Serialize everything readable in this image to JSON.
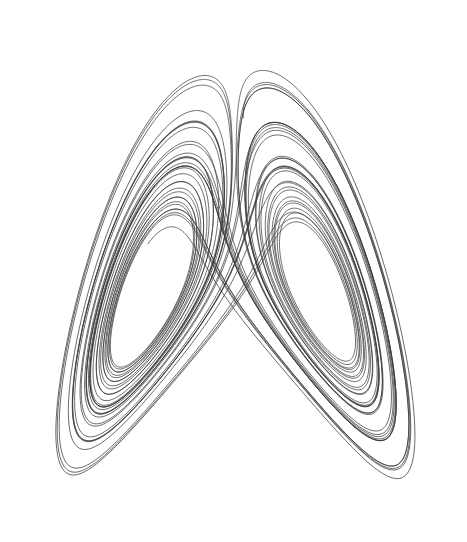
{
  "figure": {
    "title": "",
    "background_color": "#ffffff",
    "width": 467,
    "height": 542
  },
  "chart_data": {
    "type": "line",
    "title": "",
    "subtitle": "",
    "xlabel": "",
    "ylabel": "",
    "legend": [],
    "legend_position": "none",
    "grid": false,
    "axes_visible": false,
    "tick_labels_x": [],
    "tick_labels_y": [],
    "series": [
      {
        "name": "lorenz-trajectory",
        "color": "#3a3a3a",
        "line_width": 0.75,
        "marker": "none"
      }
    ],
    "system": {
      "name": "Lorenz",
      "equations": [
        "dx/dt = sigma*(y - x)",
        "dy/dt = x*(rho - z) - y",
        "dz/dt = x*y - beta*z"
      ],
      "sigma": 10.0,
      "rho": 28.0,
      "beta": 2.6666666667,
      "initial_state": [
        0.9,
        0.6,
        10.5
      ],
      "dt": 0.0035,
      "steps": 13800,
      "burn_in": 0,
      "projection": "xz"
    },
    "xlim": [
      -21.5,
      21.5
    ],
    "ylim": [
      0.5,
      49.5
    ],
    "pixel_bounds": {
      "x_min": 18,
      "x_max": 451,
      "y_top": 13,
      "y_bottom": 531
    },
    "features": {
      "left_lobe_center_px": [
        131,
        246
      ],
      "right_lobe_center_px": [
        341,
        241
      ],
      "saddle_crossing_px": [
        245,
        295
      ],
      "left_apex_px": [
        22,
        60
      ],
      "right_apex_px": [
        430,
        14
      ],
      "bottom_extent_px": [
        283,
        530
      ]
    }
  }
}
